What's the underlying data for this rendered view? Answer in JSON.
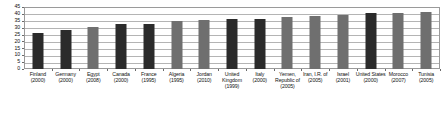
{
  "chart_data": {
    "type": "bar",
    "title": "",
    "subtitle": "",
    "xlabel": "",
    "ylabel": "",
    "ylim": [
      0,
      45
    ],
    "grid": true,
    "legend_position": "none",
    "y_ticks": [
      0,
      5,
      10,
      15,
      20,
      25,
      30,
      35,
      40,
      45
    ],
    "y_tick_labels": [
      "0",
      "5",
      "10",
      "15",
      "20",
      "25",
      "30",
      "35",
      "40",
      "45"
    ],
    "categories": [
      "Finland (2000)",
      "Germany (2000)",
      "Egypt (2008)",
      "Canada (2000)",
      "France (1995)",
      "Algeria (1995)",
      "Jordan (2010)",
      "United Kingdom (1999)",
      "Italy (2000)",
      "Yemen, Republic of (2005)",
      "Iran, I.R. of (2005)",
      "Israel (2001)",
      "United States (2000)",
      "Morocco (2007)",
      "Tunisia (2005)"
    ],
    "category_names": [
      "Finland",
      "Germany",
      "Egypt",
      "Canada",
      "France",
      "Algeria",
      "Jordan",
      "United Kingdom",
      "Italy",
      "Yemen, Republic of",
      "Iran, I.R. of",
      "Israel",
      "United States",
      "Morocco",
      "Tunisia"
    ],
    "category_years": [
      "(2000)",
      "(2000)",
      "(2008)",
      "(2000)",
      "(1995)",
      "(1995)",
      "(2010)",
      "(1999)",
      "(2000)",
      "(2005)",
      "(2005)",
      "(2001)",
      "(2000)",
      "(2007)",
      "(2005)"
    ],
    "values": [
      26,
      28,
      30.5,
      32.5,
      33,
      35,
      35.5,
      36,
      36,
      37.5,
      38.5,
      39,
      41,
      40.5,
      41.5
    ],
    "bar_colors": [
      "#2b2b2b",
      "#2b2b2b",
      "#6f6f6f",
      "#2b2b2b",
      "#2b2b2b",
      "#6f6f6f",
      "#6f6f6f",
      "#2b2b2b",
      "#2b2b2b",
      "#6f6f6f",
      "#6f6f6f",
      "#6f6f6f",
      "#2b2b2b",
      "#6f6f6f",
      "#6f6f6f"
    ],
    "bar_color_classes": [
      "dark",
      "dark",
      "gray",
      "dark",
      "dark",
      "gray",
      "gray",
      "dark",
      "dark",
      "gray",
      "gray",
      "gray",
      "dark",
      "gray",
      "gray"
    ]
  },
  "colors": {
    "dark_bar": "#2b2b2b",
    "gray_bar": "#6f6f6f",
    "gridline": "#b4b4b4",
    "axis": "#9a9a9a",
    "text": "#111111",
    "background": "#ffffff"
  }
}
